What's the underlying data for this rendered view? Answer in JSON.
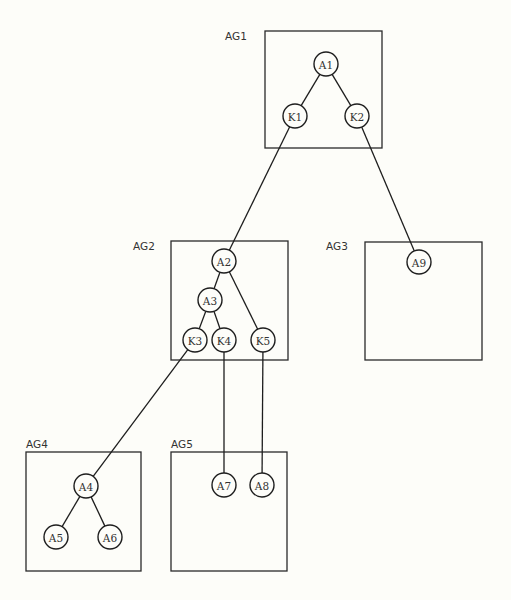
{
  "diagram": {
    "type": "hierarchical-group-tree",
    "groups": [
      {
        "id": "AG1",
        "label": "AG1",
        "box": {
          "x": 265,
          "y": 31,
          "w": 117,
          "h": 117
        },
        "label_pos": {
          "x": 225,
          "y": 40
        }
      },
      {
        "id": "AG2",
        "label": "AG2",
        "box": {
          "x": 171,
          "y": 241,
          "w": 117,
          "h": 119
        },
        "label_pos": {
          "x": 133,
          "y": 250
        }
      },
      {
        "id": "AG3",
        "label": "AG3",
        "box": {
          "x": 365,
          "y": 242,
          "w": 117,
          "h": 118
        },
        "label_pos": {
          "x": 326,
          "y": 250
        }
      },
      {
        "id": "AG4",
        "label": "AG4",
        "box": {
          "x": 26,
          "y": 452,
          "w": 115,
          "h": 119
        },
        "label_pos": {
          "x": 26,
          "y": 448
        }
      },
      {
        "id": "AG5",
        "label": "AG5",
        "box": {
          "x": 171,
          "y": 452,
          "w": 116,
          "h": 119
        },
        "label_pos": {
          "x": 171,
          "y": 448
        }
      }
    ],
    "nodes": [
      {
        "id": "A1",
        "label": "A1",
        "group": "AG1",
        "cx": 326,
        "cy": 64
      },
      {
        "id": "K1",
        "label": "K1",
        "group": "AG1",
        "cx": 295,
        "cy": 116
      },
      {
        "id": "K2",
        "label": "K2",
        "group": "AG1",
        "cx": 357,
        "cy": 116
      },
      {
        "id": "A2",
        "label": "A2",
        "group": "AG2",
        "cx": 224,
        "cy": 261
      },
      {
        "id": "A3",
        "label": "A3",
        "group": "AG2",
        "cx": 210,
        "cy": 300
      },
      {
        "id": "K3",
        "label": "K3",
        "group": "AG2",
        "cx": 195,
        "cy": 340
      },
      {
        "id": "K4",
        "label": "K4",
        "group": "AG2",
        "cx": 224,
        "cy": 340
      },
      {
        "id": "K5",
        "label": "K5",
        "group": "AG2",
        "cx": 263,
        "cy": 340
      },
      {
        "id": "A9",
        "label": "A9",
        "group": "AG3",
        "cx": 419,
        "cy": 262
      },
      {
        "id": "A4",
        "label": "A4",
        "group": "AG4",
        "cx": 86,
        "cy": 486
      },
      {
        "id": "A5",
        "label": "A5",
        "group": "AG4",
        "cx": 56,
        "cy": 537
      },
      {
        "id": "A6",
        "label": "A6",
        "group": "AG4",
        "cx": 110,
        "cy": 537
      },
      {
        "id": "A7",
        "label": "A7",
        "group": "AG5",
        "cx": 224,
        "cy": 485
      },
      {
        "id": "A8",
        "label": "A8",
        "group": "AG5",
        "cx": 262,
        "cy": 485
      }
    ],
    "edges": [
      {
        "from": "A1",
        "to": "K1"
      },
      {
        "from": "A1",
        "to": "K2"
      },
      {
        "from": "K1",
        "to": "A2"
      },
      {
        "from": "K2",
        "to": "A9"
      },
      {
        "from": "A2",
        "to": "A3"
      },
      {
        "from": "A2",
        "to": "K5"
      },
      {
        "from": "A3",
        "to": "K3"
      },
      {
        "from": "A3",
        "to": "K4"
      },
      {
        "from": "K3",
        "to": "A4"
      },
      {
        "from": "K4",
        "to": "A7"
      },
      {
        "from": "K5",
        "to": "A8"
      },
      {
        "from": "A4",
        "to": "A5"
      },
      {
        "from": "A4",
        "to": "A6"
      }
    ],
    "node_radius": 12
  }
}
